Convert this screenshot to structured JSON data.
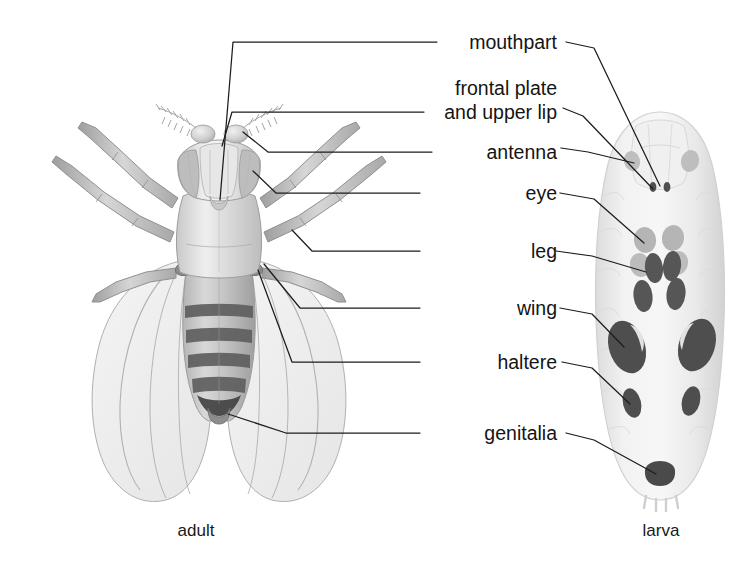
{
  "figure": {
    "background": "#ffffff",
    "line_color": "#1c1c1c",
    "text_color": "#141414"
  },
  "captions": {
    "left": "adult",
    "right": "larva"
  },
  "labels": [
    {
      "id": "mouthpart",
      "text": "mouthpart",
      "x": 557,
      "y": 42,
      "lines": 1
    },
    {
      "id": "frontal",
      "text": "frontal plate",
      "x": 557,
      "y": 88,
      "lines": 2,
      "text2": "and upper lip",
      "y2": 112
    },
    {
      "id": "antenna",
      "text": "antenna",
      "x": 557,
      "y": 152,
      "lines": 1
    },
    {
      "id": "eye",
      "text": "eye",
      "x": 557,
      "y": 199,
      "lines": 1
    },
    {
      "id": "leg",
      "text": "leg",
      "x": 557,
      "y": 257,
      "lines": 1
    },
    {
      "id": "wing",
      "text": "wing",
      "x": 557,
      "y": 313,
      "lines": 1
    },
    {
      "id": "haltere",
      "text": "haltere",
      "x": 557,
      "y": 368,
      "lines": 1
    },
    {
      "id": "genitalia",
      "text": "genitalia",
      "x": 557,
      "y": 439,
      "lines": 1
    }
  ],
  "anatomy": {
    "adult_parts": [
      "head",
      "compound-eye",
      "antenna",
      "frontal-plate",
      "mouthpart",
      "thorax",
      "legs",
      "wings",
      "halteres",
      "abdomen",
      "genitalia"
    ],
    "larva_discs": [
      "eye-antenna-disc",
      "leg-disc",
      "wing-disc",
      "haltere-disc",
      "genital-disc"
    ],
    "disc_tone_light": "#b9b9b9",
    "disc_tone_dark": "#565656",
    "body_tone": "#ededed"
  }
}
